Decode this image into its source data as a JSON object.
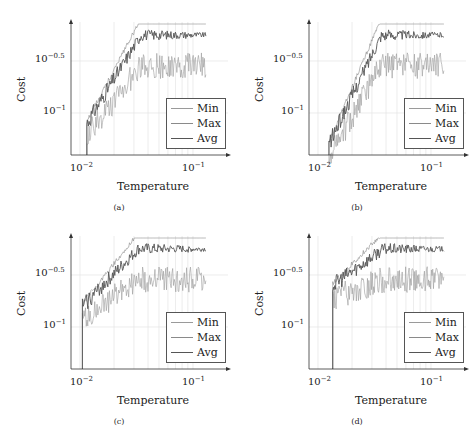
{
  "chart_data": [
    {
      "type": "line",
      "panel": "a",
      "caption": "(a)",
      "xlabel": "Temperature",
      "ylabel": "Cost",
      "xscale": "log",
      "yscale": "log",
      "xticks": [
        "10^-2",
        "10^-1"
      ],
      "yticks": [
        "10^-1",
        "10^-0.5"
      ],
      "legend": [
        "Min",
        "Max",
        "Avg"
      ],
      "legend_position": "lower right",
      "grid": true,
      "series": [
        {
          "name": "Min",
          "x_start": 0.0115,
          "x_end": 0.13,
          "y_start_log": -1.1,
          "plateau_log": -0.42,
          "noise": 0.25
        },
        {
          "name": "Max",
          "x_start": 0.0115,
          "x_end": 0.13,
          "y_start_log": -1.1,
          "plateau_log": -0.12,
          "noise": 0.08
        },
        {
          "name": "Avg",
          "x_start": 0.0115,
          "x_end": 0.13,
          "y_start_log": -1.1,
          "plateau_log": -0.25,
          "noise": 0.06
        }
      ]
    },
    {
      "type": "line",
      "panel": "b",
      "caption": "(b)",
      "xlabel": "Temperature",
      "ylabel": "Cost",
      "xscale": "log",
      "yscale": "log",
      "xticks": [
        "10^-2",
        "10^-1"
      ],
      "yticks": [
        "10^-1",
        "10^-0.5"
      ],
      "legend": [
        "Min",
        "Max",
        "Avg"
      ],
      "legend_position": "lower right",
      "grid": true,
      "series": [
        {
          "name": "Min",
          "x_start": 0.0125,
          "x_end": 0.13,
          "y_start_log": -1.3,
          "plateau_log": -0.42,
          "noise": 0.25
        },
        {
          "name": "Max",
          "x_start": 0.0125,
          "x_end": 0.13,
          "y_start_log": -1.3,
          "plateau_log": -0.12,
          "noise": 0.08
        },
        {
          "name": "Avg",
          "x_start": 0.0125,
          "x_end": 0.13,
          "y_start_log": -1.3,
          "plateau_log": -0.25,
          "noise": 0.06
        }
      ]
    },
    {
      "type": "line",
      "panel": "c",
      "caption": "(c)",
      "xlabel": "Temperature",
      "ylabel": "Cost",
      "xscale": "log",
      "yscale": "log",
      "xticks": [
        "10^-2",
        "10^-1"
      ],
      "yticks": [
        "10^-1",
        "10^-0.5"
      ],
      "legend": [
        "Min",
        "Max",
        "Avg"
      ],
      "legend_position": "lower right",
      "grid": true,
      "series": [
        {
          "name": "Min",
          "x_start": 0.0105,
          "x_end": 0.13,
          "y_start_log": -0.8,
          "plateau_log": -0.42,
          "noise": 0.25
        },
        {
          "name": "Max",
          "x_start": 0.0105,
          "x_end": 0.13,
          "y_start_log": -0.8,
          "plateau_log": -0.12,
          "noise": 0.08
        },
        {
          "name": "Avg",
          "x_start": 0.0105,
          "x_end": 0.13,
          "y_start_log": -0.8,
          "plateau_log": -0.25,
          "noise": 0.06
        }
      ]
    },
    {
      "type": "line",
      "panel": "d",
      "caption": "(d)",
      "xlabel": "Temperature",
      "ylabel": "Cost",
      "xscale": "log",
      "yscale": "log",
      "xticks": [
        "10^-2",
        "10^-1"
      ],
      "yticks": [
        "10^-1",
        "10^-0.5"
      ],
      "legend": [
        "Min",
        "Max",
        "Avg"
      ],
      "legend_position": "lower right",
      "grid": true,
      "series": [
        {
          "name": "Min",
          "x_start": 0.0135,
          "x_end": 0.13,
          "y_start_log": -0.6,
          "plateau_log": -0.42,
          "noise": 0.25
        },
        {
          "name": "Max",
          "x_start": 0.0135,
          "x_end": 0.13,
          "y_start_log": -0.6,
          "plateau_log": -0.12,
          "noise": 0.08
        },
        {
          "name": "Avg",
          "x_start": 0.0135,
          "x_end": 0.13,
          "y_start_log": -0.6,
          "plateau_log": -0.25,
          "noise": 0.06
        }
      ]
    }
  ]
}
